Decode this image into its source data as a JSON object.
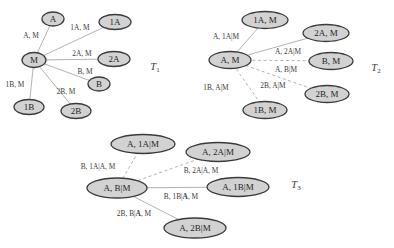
{
  "figure": {
    "colors": {
      "background": "#ffffff",
      "node_fill": "#d2d2d2",
      "node_border": "#3a3a3a",
      "edge_line": "#a9a9a9",
      "node_text": "#1f1f1f",
      "edge_label_text": "#3c3c3c",
      "tree_label_text": "#3c3c3c"
    },
    "trees": [
      {
        "id": "T1",
        "label": {
          "base": "T",
          "sub": "1",
          "x": 155,
          "y": 66
        },
        "nodes": [
          {
            "id": "M",
            "label": "M",
            "x": 34,
            "y": 60,
            "rx": 12,
            "ry": 7.5
          },
          {
            "id": "A",
            "label": "A",
            "x": 53,
            "y": 19,
            "rx": 11,
            "ry": 7
          },
          {
            "id": "1A",
            "label": "1A",
            "x": 115,
            "y": 22,
            "rx": 16,
            "ry": 7.5
          },
          {
            "id": "2A",
            "label": "2A",
            "x": 114,
            "y": 59,
            "rx": 16,
            "ry": 7.5
          },
          {
            "id": "B",
            "label": "B",
            "x": 99,
            "y": 84,
            "rx": 11,
            "ry": 7
          },
          {
            "id": "1B",
            "label": "1B",
            "x": 29,
            "y": 107,
            "rx": 15,
            "ry": 7.5
          },
          {
            "id": "2B",
            "label": "2B",
            "x": 76,
            "y": 111,
            "rx": 15,
            "ry": 7.5
          }
        ],
        "edges": [
          {
            "from": "M",
            "to": "A",
            "style": "solid",
            "parts": [
              {
                "t": "A, M"
              }
            ],
            "lx": 31,
            "ly": 35
          },
          {
            "from": "M",
            "to": "1A",
            "style": "solid",
            "parts": [
              {
                "t": "1A, M"
              }
            ],
            "lx": 80,
            "ly": 27
          },
          {
            "from": "M",
            "to": "2A",
            "style": "solid",
            "parts": [
              {
                "t": "2A, M"
              }
            ],
            "lx": 82,
            "ly": 53
          },
          {
            "from": "M",
            "to": "B",
            "style": "solid",
            "parts": [
              {
                "t": "B, M"
              }
            ],
            "lx": 85,
            "ly": 71
          },
          {
            "from": "M",
            "to": "1B",
            "style": "solid",
            "parts": [
              {
                "t": "1B, M"
              }
            ],
            "lx": 15,
            "ly": 84
          },
          {
            "from": "M",
            "to": "2B",
            "style": "solid",
            "parts": [
              {
                "t": "2B, M"
              }
            ],
            "lx": 66,
            "ly": 91
          }
        ]
      },
      {
        "id": "T2",
        "label": {
          "base": "T",
          "sub": "2",
          "x": 376,
          "y": 67
        },
        "nodes": [
          {
            "id": "AM",
            "label": "A, M",
            "x": 230,
            "y": 60,
            "rx": 21,
            "ry": 8.5
          },
          {
            "id": "1AM",
            "label": "1A, M",
            "x": 265,
            "y": 20,
            "rx": 23,
            "ry": 8.5
          },
          {
            "id": "2AM",
            "label": "2A, M",
            "x": 326,
            "y": 33,
            "rx": 23,
            "ry": 8.5
          },
          {
            "id": "BM",
            "label": "B, M",
            "x": 331,
            "y": 61,
            "rx": 22,
            "ry": 8.5
          },
          {
            "id": "2BM",
            "label": "2B, M",
            "x": 327,
            "y": 94,
            "rx": 22,
            "ry": 8.5
          },
          {
            "id": "1BM",
            "label": "1B, M",
            "x": 265,
            "y": 110,
            "rx": 22,
            "ry": 8.5
          }
        ],
        "edges": [
          {
            "from": "AM",
            "to": "1AM",
            "style": "solid",
            "parts": [
              {
                "t": "A, 1A|M"
              }
            ],
            "lx": 226,
            "ly": 36
          },
          {
            "from": "AM",
            "to": "2AM",
            "style": "solid",
            "parts": [
              {
                "t": "A, 2A|M"
              }
            ],
            "lx": 288,
            "ly": 51
          },
          {
            "from": "AM",
            "to": "BM",
            "style": "dashed",
            "parts": [
              {
                "t": "A, B|M"
              }
            ],
            "lx": 286,
            "ly": 69
          },
          {
            "from": "AM",
            "to": "1BM",
            "style": "dashed",
            "parts": [
              {
                "t": "1B, A|M"
              }
            ],
            "lx": 216,
            "ly": 87
          },
          {
            "from": "AM",
            "to": "2BM",
            "style": "dashed",
            "parts": [
              {
                "t": "2B, A|M"
              }
            ],
            "lx": 273,
            "ly": 85
          }
        ]
      },
      {
        "id": "T3",
        "label": {
          "base": "T",
          "sub": "3",
          "x": 296,
          "y": 184
        },
        "nodes": [
          {
            "id": "ABM",
            "label": "A, B|M",
            "x": 117,
            "y": 188,
            "rx": 30,
            "ry": 10
          },
          {
            "id": "A1AM",
            "label": "A, 1A|M",
            "x": 143,
            "y": 144,
            "rx": 32,
            "ry": 9.5
          },
          {
            "id": "A2AM",
            "label": "A, 2A|M",
            "x": 218,
            "y": 152,
            "rx": 32,
            "ry": 9.5
          },
          {
            "id": "A1BM",
            "label": "A, 1B|M",
            "x": 238,
            "y": 187,
            "rx": 31,
            "ry": 9.5
          },
          {
            "id": "A2BM",
            "label": "A, 2B|M",
            "x": 195,
            "y": 228,
            "rx": 31,
            "ry": 10
          }
        ],
        "edges": [
          {
            "from": "ABM",
            "to": "A1AM",
            "style": "dashed",
            "parts": [
              {
                "t": "B, 1A|A, M"
              }
            ],
            "lx": 98,
            "ly": 166
          },
          {
            "from": "ABM",
            "to": "A2AM",
            "style": "dashed",
            "parts": [
              {
                "t": "B, 2A|A, M"
              }
            ],
            "lx": 201,
            "ly": 170
          },
          {
            "from": "ABM",
            "to": "A1BM",
            "style": "solid",
            "parts": [
              {
                "t": "B, 1B|"
              },
              {
                "t": "A",
                "b": true
              },
              {
                "t": ", M"
              }
            ],
            "lx": 181,
            "ly": 196
          },
          {
            "from": "ABM",
            "to": "A2BM",
            "style": "solid",
            "parts": [
              {
                "t": "2B, B|"
              },
              {
                "t": "A",
                "b": true
              },
              {
                "t": ", M"
              }
            ],
            "lx": 134,
            "ly": 213
          }
        ]
      }
    ]
  }
}
